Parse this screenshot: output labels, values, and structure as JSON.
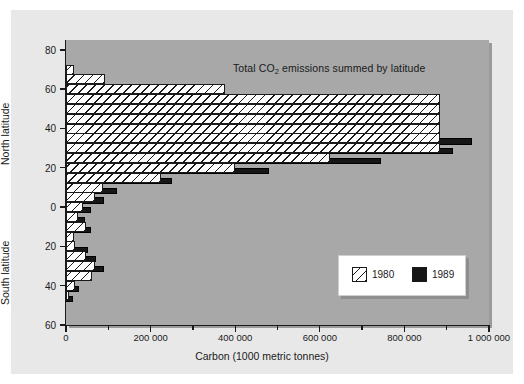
{
  "chart_data": {
    "type": "bar",
    "orientation": "horizontal",
    "title": "Total CO2 emissions summed by latitude",
    "title_prefix": "Total CO",
    "title_sub": "2",
    "title_suffix": " emissions summed by latitude",
    "xlabel": "Carbon (1000 metric tonnes)",
    "ylabel_north": "North latitude",
    "ylabel_south": "South latitude",
    "xlim": [
      0,
      1000000
    ],
    "ylim_top": 85,
    "ylim_bottom": -60,
    "grid": false,
    "legend_position": "lower-right",
    "xticks": [
      0,
      200000,
      400000,
      600000,
      800000,
      1000000
    ],
    "xticklabels": [
      "0",
      "200 000",
      "400 000",
      "600 000",
      "800 000",
      "1 000 000"
    ],
    "xticks_minor": [
      100000,
      300000,
      500000,
      700000,
      900000
    ],
    "yticks": [
      80,
      60,
      40,
      20,
      0,
      -20,
      -40,
      -60
    ],
    "yticklabels": [
      "80",
      "60",
      "40",
      "20",
      "0",
      "20",
      "40",
      "60"
    ],
    "series": [
      {
        "name": "1980",
        "color": "#ffffff",
        "pattern": "diagonal-hatch",
        "bins": [
          {
            "lat": 70,
            "value": 18000
          },
          {
            "lat": 65,
            "value": 92000
          },
          {
            "lat": 60,
            "value": 375000
          },
          {
            "lat": 55,
            "value": 885000
          },
          {
            "lat": 50,
            "value": 885000
          },
          {
            "lat": 45,
            "value": 885000
          },
          {
            "lat": 40,
            "value": 885000
          },
          {
            "lat": 35,
            "value": 885000
          },
          {
            "lat": 30,
            "value": 885000
          },
          {
            "lat": 25,
            "value": 625000
          },
          {
            "lat": 20,
            "value": 400000
          },
          {
            "lat": 15,
            "value": 225000
          },
          {
            "lat": 10,
            "value": 88000
          },
          {
            "lat": 5,
            "value": 68000
          },
          {
            "lat": 0,
            "value": 40000
          },
          {
            "lat": -5,
            "value": 28000
          },
          {
            "lat": -10,
            "value": 48000
          },
          {
            "lat": -15,
            "value": 20000
          },
          {
            "lat": -20,
            "value": 22000
          },
          {
            "lat": -25,
            "value": 48000
          },
          {
            "lat": -30,
            "value": 68000
          },
          {
            "lat": -35,
            "value": 62000
          },
          {
            "lat": -40,
            "value": 22000
          },
          {
            "lat": -45,
            "value": 8000
          }
        ]
      },
      {
        "name": "1989",
        "color": "#161616",
        "pattern": "solid",
        "bins": [
          {
            "lat": 55,
            "value": 325000
          },
          {
            "lat": 45,
            "value": 660000
          },
          {
            "lat": 40,
            "value": 770000
          },
          {
            "lat": 35,
            "value": 960000
          },
          {
            "lat": 30,
            "value": 915000
          },
          {
            "lat": 25,
            "value": 745000
          },
          {
            "lat": 20,
            "value": 480000
          },
          {
            "lat": 15,
            "value": 250000
          },
          {
            "lat": 10,
            "value": 120000
          },
          {
            "lat": 5,
            "value": 90000
          },
          {
            "lat": 0,
            "value": 58000
          },
          {
            "lat": -5,
            "value": 44000
          },
          {
            "lat": -10,
            "value": 58000
          },
          {
            "lat": -20,
            "value": 52000
          },
          {
            "lat": -25,
            "value": 72000
          },
          {
            "lat": -30,
            "value": 90000
          },
          {
            "lat": -40,
            "value": 30000
          },
          {
            "lat": -45,
            "value": 16000
          }
        ]
      }
    ],
    "legend": [
      {
        "label": "1980",
        "swatch": "hatch"
      },
      {
        "label": "1989",
        "swatch": "solid-black"
      }
    ]
  }
}
